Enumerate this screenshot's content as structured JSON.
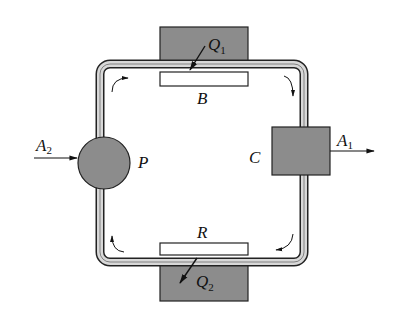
{
  "diagram": {
    "colors": {
      "component_fill": "#8c8c8c",
      "pipe_fill": "#d8d8d8",
      "line": "#222222",
      "background": "#ffffff"
    },
    "labels": {
      "Q1": {
        "main": "Q",
        "sub": "1"
      },
      "Q2": {
        "main": "Q",
        "sub": "2"
      },
      "A1": {
        "main": "A",
        "sub": "1"
      },
      "A2": {
        "main": "A",
        "sub": "2"
      },
      "B": "B",
      "R": "R",
      "P": "P",
      "C": "C"
    },
    "components": [
      {
        "id": "heat-source-top",
        "label": "Q1",
        "shape": "rect"
      },
      {
        "id": "B",
        "label": "B",
        "shape": "rect-white"
      },
      {
        "id": "P",
        "label": "P",
        "shape": "circle"
      },
      {
        "id": "C",
        "label": "C",
        "shape": "rect"
      },
      {
        "id": "R",
        "label": "R",
        "shape": "rect-white"
      },
      {
        "id": "heat-sink-bottom",
        "label": "Q2",
        "shape": "rect"
      }
    ],
    "flow": "clockwise loop: B -> C -> R -> P -> B",
    "inputs": [
      "A2 into P"
    ],
    "outputs": [
      "A1 out of C"
    ]
  }
}
